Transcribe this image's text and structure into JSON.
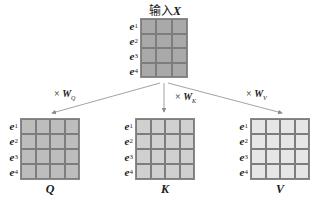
{
  "input": {
    "title_prefix": "输入",
    "title_var": "X",
    "rows": [
      "e",
      "e",
      "e",
      "e"
    ],
    "row_subs": [
      "1",
      "2",
      "3",
      "4"
    ],
    "cols": 3,
    "fill": "#a9a9a9"
  },
  "transforms": [
    {
      "times": "×",
      "w": "W",
      "sub": "Q"
    },
    {
      "times": "×",
      "w": "W",
      "sub": "K"
    },
    {
      "times": "×",
      "w": "W",
      "sub": "V"
    }
  ],
  "outputs": [
    {
      "label": "Q",
      "fill": "#bdbdbd",
      "cols": 4,
      "row_subs": [
        "1",
        "2",
        "3",
        "4"
      ]
    },
    {
      "label": "K",
      "fill": "#d0d0d0",
      "cols": 4,
      "row_subs": [
        "1",
        "2",
        "3",
        "4"
      ]
    },
    {
      "label": "V",
      "fill": "#e6e6e6",
      "cols": 4,
      "row_subs": [
        "1",
        "2",
        "3",
        "4"
      ]
    }
  ],
  "row_symbol": "e",
  "colors": {
    "arrow": "#8c8c8c",
    "grid_line": "#7d7d7d",
    "text": "#1a1a1a"
  }
}
